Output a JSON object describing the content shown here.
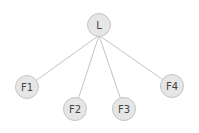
{
  "diagram": {
    "type": "tree",
    "colors": {
      "background": "#ffffff",
      "node_fill": "#e6e6e6",
      "node_stroke": "#c4c4c4",
      "edge": "#bcbcbc",
      "label": "#444444"
    },
    "nodes": [
      {
        "id": "L",
        "label": "L",
        "x": 99,
        "y": 25,
        "r": 11.5
      },
      {
        "id": "F1",
        "label": "F1",
        "x": 27,
        "y": 87,
        "r": 11.5
      },
      {
        "id": "F2",
        "label": "F2",
        "x": 75,
        "y": 109,
        "r": 11.5
      },
      {
        "id": "F3",
        "label": "F3",
        "x": 124,
        "y": 109,
        "r": 11.5
      },
      {
        "id": "F4",
        "label": "F4",
        "x": 172,
        "y": 86,
        "r": 11.5
      }
    ],
    "edges": [
      {
        "from": "L",
        "to": "F1"
      },
      {
        "from": "L",
        "to": "F2"
      },
      {
        "from": "L",
        "to": "F3"
      },
      {
        "from": "L",
        "to": "F4"
      }
    ]
  }
}
